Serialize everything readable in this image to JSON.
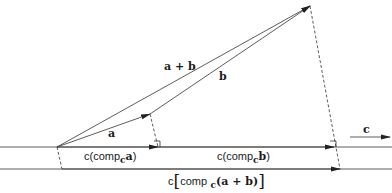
{
  "diagram": {
    "type": "vector projection diagram",
    "vectors": {
      "a": {
        "label": "a"
      },
      "b": {
        "label": "b"
      },
      "a_plus_b": {
        "label": "a + b"
      },
      "c": {
        "label": "c"
      }
    },
    "projections": {
      "comp_a": {
        "prefix": "c(comp",
        "sub": "c",
        "vec": "a",
        "suffix": ")"
      },
      "comp_b": {
        "prefix": "c(comp",
        "sub": "c",
        "vec": "b",
        "suffix": ")"
      },
      "comp_ab": {
        "c": "c",
        "open": "[",
        "comp": "comp",
        "sub": "c",
        "vec": "(a + b)",
        "close": "]"
      }
    },
    "colors": {
      "line": "#2a2a2a",
      "background": "#ffffff"
    }
  }
}
